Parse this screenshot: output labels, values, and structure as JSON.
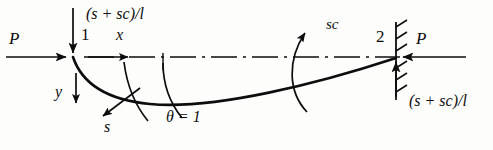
{
  "figure": {
    "labels": {
      "axial_load_left": "P",
      "axial_load_right": "P",
      "node_near": "1",
      "node_far": "2",
      "axis_x": "x",
      "axis_y": "y",
      "arc_length": "s",
      "moment_carryover": "sc",
      "shear_top_left": "(s + sc)/l",
      "shear_bottom_right": "(s + sc)/l",
      "rotation": "θ = 1"
    },
    "icons": {
      "axial_arrow_left": "arrow-right-icon",
      "axial_arrow_right": "arrow-left-icon",
      "shear_arrow_down": "arrow-down-icon",
      "shear_arrow_up": "arrow-up-icon",
      "x_axis_arrow": "arrow-right-icon",
      "y_axis_arrow": "arrow-down-icon",
      "s_axis_arrow": "arrow-down-left-icon",
      "moment_arrow_sc": "curved-arrow-up-icon",
      "rotation_arc": "arc-icon",
      "support_hatch": "fixed-support-hatch-icon",
      "centerline": "dash-dot-centerline-icon",
      "deflected_shape": "deflected-beam-curve-icon"
    },
    "colors": {
      "ink": "#0d0d0d",
      "background": "#fdfdfc"
    },
    "geometry": {
      "node_near_x": 73,
      "node_near_y": 57,
      "node_far_x": 396,
      "node_far_y": 57,
      "span_px": 323,
      "max_deflection_px": 40
    }
  }
}
